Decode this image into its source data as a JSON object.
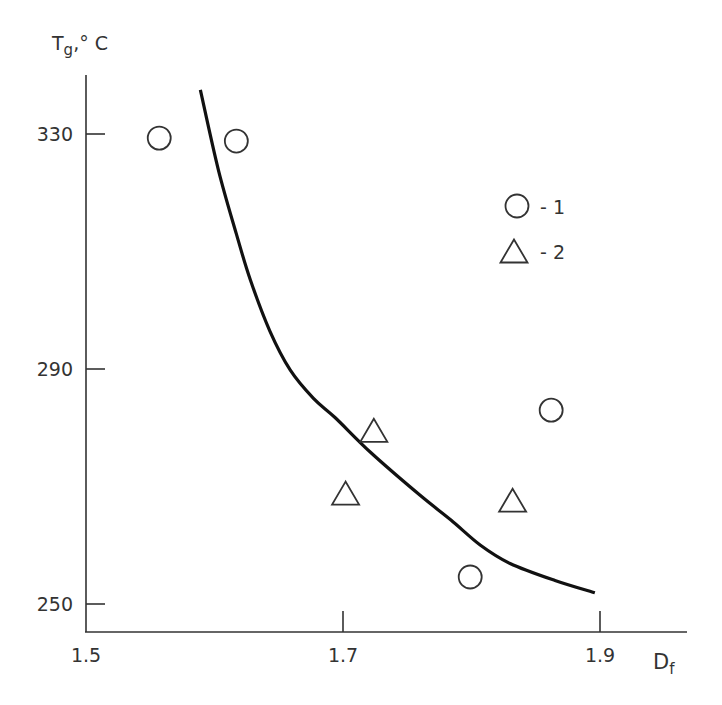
{
  "chart_data": {
    "type": "scatter",
    "title": "",
    "xlabel": "Df",
    "ylabel": "Tg,° C",
    "xlim": [
      1.5,
      1.98
    ],
    "ylim": [
      245,
      340
    ],
    "grid": false,
    "legend_position": "upper right",
    "x_ticks": [
      1.5,
      1.7,
      1.9
    ],
    "x_tick_labels": [
      "1.5",
      "1.7",
      "1.9"
    ],
    "y_ticks": [
      250,
      290,
      330
    ],
    "y_tick_labels": [
      "250",
      "290",
      "330"
    ],
    "series": [
      {
        "name": "1",
        "marker": "circle",
        "points": [
          {
            "x": 1.557,
            "y": 329.3
          },
          {
            "x": 1.617,
            "y": 328.8
          },
          {
            "x": 1.862,
            "y": 283.0
          },
          {
            "x": 1.799,
            "y": 254.6
          }
        ]
      },
      {
        "name": "2",
        "marker": "triangle",
        "points": [
          {
            "x": 1.724,
            "y": 279.4
          },
          {
            "x": 1.702,
            "y": 268.7
          },
          {
            "x": 1.832,
            "y": 267.5
          }
        ]
      },
      {
        "name": "fit curve",
        "marker": "line",
        "points": [
          {
            "x": 1.589,
            "y": 337.5
          },
          {
            "x": 1.603,
            "y": 323.9
          },
          {
            "x": 1.617,
            "y": 313.0
          },
          {
            "x": 1.628,
            "y": 305.1
          },
          {
            "x": 1.643,
            "y": 296.5
          },
          {
            "x": 1.659,
            "y": 289.8
          },
          {
            "x": 1.677,
            "y": 285.0
          },
          {
            "x": 1.694,
            "y": 281.7
          },
          {
            "x": 1.722,
            "y": 275.7
          },
          {
            "x": 1.76,
            "y": 268.5
          },
          {
            "x": 1.784,
            "y": 264.3
          },
          {
            "x": 1.807,
            "y": 260.0
          },
          {
            "x": 1.83,
            "y": 256.9
          },
          {
            "x": 1.865,
            "y": 254.0
          },
          {
            "x": 1.896,
            "y": 251.9
          }
        ]
      }
    ]
  },
  "axes": {
    "y_title_main": "T",
    "y_title_sub": "g",
    "y_title_rest": ",° C",
    "x_title_main": "D",
    "x_title_sub": "f"
  },
  "legend": {
    "items": [
      {
        "marker": "circle",
        "label": "- 1"
      },
      {
        "marker": "triangle",
        "label": "- 2"
      }
    ]
  },
  "style": {
    "line_color": "#111111",
    "axis_color": "#333333",
    "marker_color": "#333333"
  }
}
